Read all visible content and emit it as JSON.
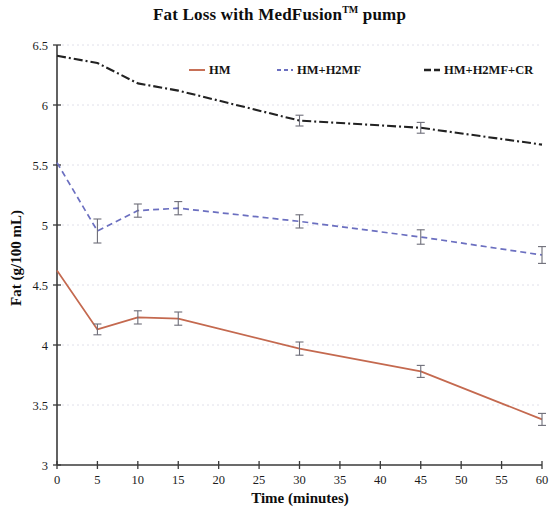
{
  "chart_data": {
    "type": "line",
    "title_main": "Fat Loss with MedFusion",
    "title_tm": "TM",
    "title_tail": " pump",
    "xlabel": "Time (minutes)",
    "ylabel": "Fat (g/100 mL)",
    "x": [
      0,
      5,
      10,
      15,
      30,
      45,
      60
    ],
    "xlim": [
      0,
      60
    ],
    "ylim": [
      3,
      6.5
    ],
    "xticks": [
      0,
      5,
      10,
      15,
      20,
      25,
      30,
      35,
      40,
      45,
      50,
      55,
      60
    ],
    "xtick_labels": [
      "0",
      "5",
      "10",
      "15",
      "20",
      "25",
      "30",
      "35",
      "40",
      "45",
      "50",
      "55",
      "60"
    ],
    "yticks": [
      3,
      3.5,
      4,
      4.5,
      5,
      5.5,
      6,
      6.5
    ],
    "ytick_labels": [
      "3",
      "3.5",
      "4",
      "4.5",
      "5",
      "5.5",
      "6",
      "6.5"
    ],
    "grid": true,
    "grid_axis": "y",
    "legend_position": "top-inside",
    "series": [
      {
        "name": "HM",
        "color": "#c4694f",
        "linestyle": "solid",
        "values": [
          4.62,
          4.13,
          4.23,
          4.22,
          3.97,
          3.78,
          3.38
        ],
        "errors": [
          0.0,
          0.045,
          0.055,
          0.055,
          0.055,
          0.05,
          0.05
        ]
      },
      {
        "name": "HM+H2MF",
        "color": "#6b6fc0",
        "linestyle": "dashed",
        "values": [
          5.52,
          4.95,
          5.12,
          5.14,
          5.03,
          4.9,
          4.75
        ],
        "errors": [
          0.0,
          0.1,
          0.055,
          0.055,
          0.055,
          0.06,
          0.07
        ]
      },
      {
        "name": "HM+H2MF+CR",
        "color": "#222222",
        "linestyle": "dashdot",
        "values": [
          6.41,
          6.35,
          6.18,
          6.12,
          5.87,
          5.81,
          5.67
        ],
        "errors": [
          0.0,
          0.0,
          0.0,
          0.0,
          0.045,
          0.045,
          0.0
        ]
      }
    ],
    "legend": [
      {
        "label": "HM",
        "color": "#c4694f",
        "linestyle": "solid"
      },
      {
        "label": "HM+H2MF",
        "color": "#6b6fc0",
        "linestyle": "dashed"
      },
      {
        "label": "HM+H2MF+CR",
        "color": "#222222",
        "linestyle": "dashdot"
      }
    ]
  }
}
